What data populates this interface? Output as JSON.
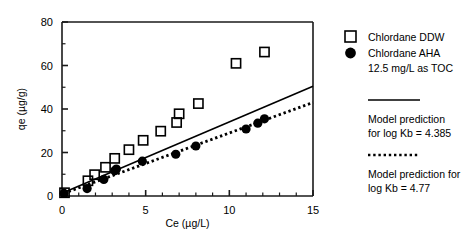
{
  "chart_data": {
    "type": "scatter",
    "title": "",
    "xlabel": "Ce (µg/L)",
    "ylabel": "qe (µg/g)",
    "xlim": [
      0,
      15
    ],
    "ylim": [
      0,
      80
    ],
    "x_ticks": [
      0,
      5,
      10,
      15
    ],
    "x_tick_labels": [
      "0",
      "5",
      "10",
      "15"
    ],
    "x_minor_step": 1,
    "y_ticks": [
      0,
      20,
      40,
      60,
      80
    ],
    "y_tick_labels": [
      "0",
      "20",
      "40",
      "60",
      "80"
    ],
    "y_minor_step": 10,
    "grid": false,
    "legend_position": "right-outside",
    "series": [
      {
        "name": "Chlordane DDW",
        "marker": "open-square",
        "color": "#000000",
        "points": [
          [
            0.15,
            1.5
          ],
          [
            1.55,
            7.0
          ],
          [
            1.95,
            9.8
          ],
          [
            2.6,
            13.2
          ],
          [
            3.15,
            17.3
          ],
          [
            4.0,
            21.3
          ],
          [
            4.85,
            25.6
          ],
          [
            5.9,
            29.8
          ],
          [
            6.85,
            33.8
          ],
          [
            7.0,
            37.8
          ],
          [
            8.15,
            42.5
          ],
          [
            10.4,
            61.0
          ],
          [
            12.1,
            66.2
          ]
        ]
      },
      {
        "name": "Chlordane AHA 12.5 mg/L as TOC",
        "marker": "filled-circle",
        "color": "#000000",
        "points": [
          [
            0.12,
            1.2
          ],
          [
            1.5,
            3.4
          ],
          [
            2.5,
            7.6
          ],
          [
            3.15,
            11.6
          ],
          [
            3.25,
            12.4
          ],
          [
            4.8,
            16.0
          ],
          [
            6.8,
            19.2
          ],
          [
            8.0,
            23.0
          ],
          [
            11.0,
            30.8
          ],
          [
            11.7,
            33.5
          ],
          [
            12.1,
            35.5
          ]
        ]
      }
    ],
    "lines": [
      {
        "name": "Model prediction for log Kb = 4.385",
        "style": "solid",
        "color": "#000000",
        "x": [
          0.1,
          15
        ],
        "y": [
          1.6,
          50.5
        ]
      },
      {
        "name": "Model prediction for log Kb = 4.77",
        "style": "dotted",
        "color": "#000000",
        "x": [
          0.1,
          15
        ],
        "y": [
          1.2,
          43.0
        ]
      }
    ]
  },
  "legend": {
    "entries": [
      {
        "label": "Chlordane DDW",
        "marker": "open-square"
      },
      {
        "label": "Chlordane AHA",
        "marker": "filled-circle"
      },
      {
        "label": "12.5 mg/L as TOC",
        "marker": "none"
      }
    ],
    "model_solid": {
      "marker": "solid-line",
      "line1": "Model prediction",
      "line2": "for log Kb  =  4.385"
    },
    "model_dotted": {
      "marker": "dotted-line",
      "line1": "Model prediction for",
      "line2": "log Kb  =  4.77"
    }
  },
  "axes": {
    "x_title": "Ce (µg/L)",
    "y_title": "qe (µg/g)"
  },
  "colors": {
    "axis": "#1a1a1a",
    "marker": "#000000",
    "background": "#ffffff"
  }
}
